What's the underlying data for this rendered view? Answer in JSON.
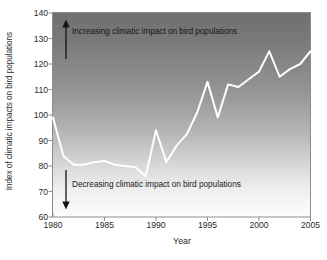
{
  "chart_data": {
    "type": "line",
    "title": "",
    "xlabel": "Year",
    "ylabel": "Index of climatic impacts on bird populations",
    "xlim": [
      1980,
      2005
    ],
    "ylim": [
      60,
      140
    ],
    "xticks": [
      1980,
      1985,
      1990,
      1995,
      2000,
      2005
    ],
    "yticks": [
      60,
      70,
      80,
      90,
      100,
      110,
      120,
      130,
      140
    ],
    "grid": false,
    "legend_position": "none",
    "series": [
      {
        "name": "Index of climatic impacts on bird populations",
        "color": "#ffffff",
        "x": [
          1980,
          1981,
          1982,
          1983,
          1984,
          1985,
          1986,
          1987,
          1988,
          1989,
          1990,
          1991,
          1992,
          1993,
          1994,
          1995,
          1996,
          1997,
          1998,
          1999,
          2000,
          2001,
          2002,
          2003,
          2004,
          2005
        ],
        "values": [
          99,
          84,
          80.5,
          80.5,
          81.5,
          82,
          80.5,
          80,
          79.5,
          76,
          94,
          81.5,
          88,
          92.5,
          101,
          113,
          99,
          112,
          111,
          114,
          117,
          125,
          115,
          118,
          120,
          125
        ]
      }
    ],
    "annotations": [
      {
        "id": "increasing",
        "text": "Increasing climatic impact on bird populations",
        "arrow": "up",
        "x": 1981,
        "y_from": 122,
        "y_to": 136
      },
      {
        "id": "decreasing",
        "text": "Decreasing climatic impact on bird populations",
        "arrow": "down",
        "x": 1981,
        "y_from": 78,
        "y_to": 63
      }
    ],
    "plot_background": {
      "type": "vertical-gradient",
      "top_color": "#757575",
      "bottom_color": "#fdfdfd"
    },
    "axis_color": "#8a8a8a"
  }
}
